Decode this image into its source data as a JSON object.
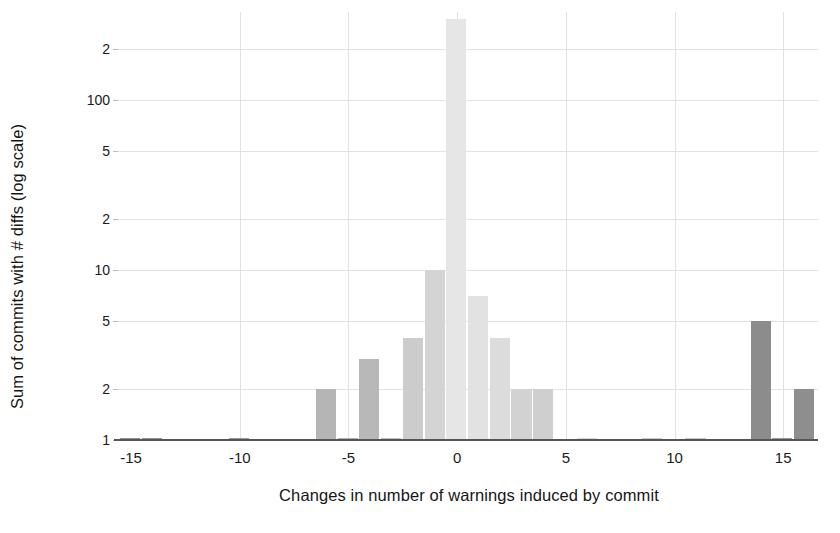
{
  "chart_data": {
    "type": "bar",
    "title": "",
    "xlabel": "Changes in number of warnings induced by commit",
    "ylabel": "Sum of commits with # diffs (log scale)",
    "yscale": "log",
    "ylim": [
      1,
      330
    ],
    "xlim": [
      -15.6,
      16.6
    ],
    "grid": true,
    "legend": "none",
    "ytick_labels": [
      "2",
      "100",
      "5",
      "2",
      "10",
      "5",
      "2",
      "1"
    ],
    "ytick_values": [
      200,
      100,
      50,
      20,
      10,
      5,
      2,
      1
    ],
    "xtick_labels": [
      "-15",
      "-10",
      "-5",
      "0",
      "5",
      "10",
      "15"
    ],
    "xtick_values": [
      -15,
      -10,
      -5,
      0,
      5,
      10,
      15
    ],
    "bar_width": 1,
    "categories": [
      -15,
      -14,
      -10,
      -6,
      -5,
      -4,
      -3,
      -2,
      -1,
      0,
      1,
      2,
      3,
      4,
      6,
      9,
      11,
      14,
      15,
      16
    ],
    "values": [
      1,
      1,
      1,
      2,
      1,
      3,
      1,
      4,
      10,
      300,
      7,
      4,
      2,
      2,
      1,
      1,
      1,
      5,
      1,
      2
    ],
    "bar_colors": [
      "#8e8e8e",
      "#8e8e8e",
      "#9a9a9a",
      "#b5b5b5",
      "#b0b0b0",
      "#b8b8b8",
      "#bdbdbd",
      "#cccccc",
      "#d4d4d4",
      "#e6e6e6",
      "#e2e2e2",
      "#dcdcdc",
      "#d2d2d2",
      "#cfcfcf",
      "#d8d8d8",
      "#cacaca",
      "#c6c6c6",
      "#8c8c8c",
      "#9a9a9a",
      "#8e8e8e"
    ]
  },
  "colors": {
    "grid": "#e2e2e2",
    "axis": "#555555",
    "text": "#1a1a1a",
    "background": "#ffffff"
  }
}
